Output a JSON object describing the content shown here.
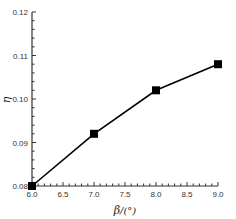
{
  "chart_data": {
    "type": "line",
    "title": "",
    "xlabel": "β/(°)",
    "ylabel": "η",
    "x": [
      6.0,
      7.0,
      8.0,
      9.0
    ],
    "series": [
      {
        "name": "η",
        "values": [
          0.08,
          0.092,
          0.102,
          0.108
        ],
        "marker": "square",
        "color": "#000000"
      }
    ],
    "xlim": [
      6.0,
      9.0
    ],
    "ylim": [
      0.08,
      0.12
    ],
    "xticks": [
      "6.0",
      "6.5",
      "7.0",
      "7.5",
      "8.0",
      "8.5",
      "9.0"
    ],
    "yticks": [
      "0.08",
      "0.09",
      "0.10",
      "0.11",
      "0.12"
    ],
    "grid": false,
    "legend": "none"
  },
  "labels": {
    "x_title_symbol": "β",
    "x_title_unit": "/(°)",
    "y_title": "η"
  },
  "colors": {
    "line": "#000000",
    "axis": "#333333"
  }
}
